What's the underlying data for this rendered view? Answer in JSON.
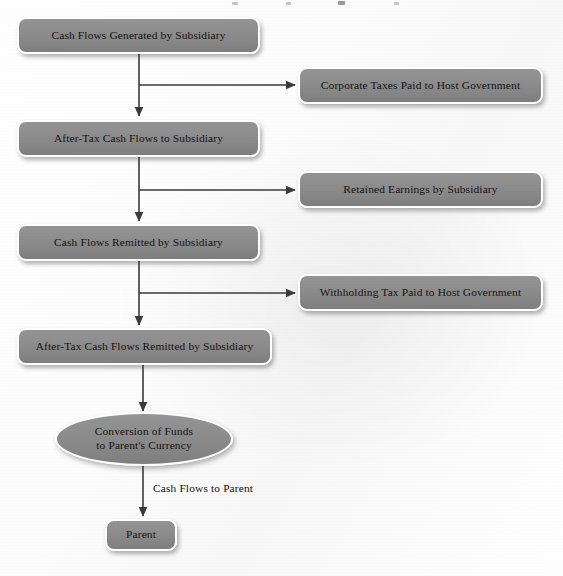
{
  "diagram": {
    "node_fill_color": "#8a8a8a",
    "node_border_color": "#ffffff",
    "text_color": "#16130f",
    "background_color": "#fbfbfb",
    "nodes": [
      {
        "id": "n1",
        "label": "Cash Flows Generated by Subsidiary",
        "shape": "rounded-rect",
        "column": "left"
      },
      {
        "id": "n2",
        "label": "Corporate Taxes Paid to Host Government",
        "shape": "rounded-rect",
        "column": "right"
      },
      {
        "id": "n3",
        "label": "After-Tax Cash Flows to Subsidiary",
        "shape": "rounded-rect",
        "column": "left"
      },
      {
        "id": "n4",
        "label": "Retained Earnings by Subsidiary",
        "shape": "rounded-rect",
        "column": "right"
      },
      {
        "id": "n5",
        "label": "Cash Flows Remitted by Subsidiary",
        "shape": "rounded-rect",
        "column": "left"
      },
      {
        "id": "n6",
        "label": "Withholding Tax Paid to Host Government",
        "shape": "rounded-rect",
        "column": "right"
      },
      {
        "id": "n7",
        "label": "After-Tax Cash Flows Remitted by Subsidiary",
        "shape": "rounded-rect",
        "column": "left"
      },
      {
        "id": "n8",
        "label_line1": "Conversion of Funds",
        "label_line2": "to Parent's Currency",
        "shape": "ellipse",
        "column": "left"
      },
      {
        "id": "n9",
        "label": "Parent",
        "shape": "rounded-rect",
        "column": "left"
      }
    ],
    "edge_labels": [
      {
        "id": "e1",
        "label": "Cash Flows to Parent",
        "from": "n8",
        "to": "n9"
      }
    ]
  }
}
